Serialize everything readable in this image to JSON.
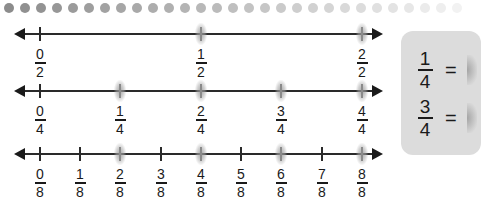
{
  "decoration": {
    "dot_row": {
      "count": 29,
      "start_x": 0,
      "spacing": 16,
      "color_start": "#8c8c8c",
      "color_end": "#f2f2f2"
    }
  },
  "number_lines": [
    {
      "id": "halves",
      "denominator": 2,
      "y": 33,
      "ticks": [
        {
          "num": "0",
          "den": "2",
          "x": 40,
          "highlighted": false
        },
        {
          "num": "1",
          "den": "2",
          "x": 201,
          "highlighted": true
        },
        {
          "num": "2",
          "den": "2",
          "x": 362,
          "highlighted": true
        }
      ]
    },
    {
      "id": "quarters",
      "denominator": 4,
      "y": 90,
      "ticks": [
        {
          "num": "0",
          "den": "4",
          "x": 40,
          "highlighted": false
        },
        {
          "num": "1",
          "den": "4",
          "x": 120,
          "highlighted": true
        },
        {
          "num": "2",
          "den": "4",
          "x": 201,
          "highlighted": true
        },
        {
          "num": "3",
          "den": "4",
          "x": 281,
          "highlighted": true
        },
        {
          "num": "4",
          "den": "4",
          "x": 362,
          "highlighted": true
        }
      ]
    },
    {
      "id": "eighths",
      "denominator": 8,
      "y": 153,
      "ticks": [
        {
          "num": "0",
          "den": "8",
          "x": 40,
          "highlighted": false
        },
        {
          "num": "1",
          "den": "8",
          "x": 80,
          "highlighted": false
        },
        {
          "num": "2",
          "den": "8",
          "x": 120,
          "highlighted": true
        },
        {
          "num": "3",
          "den": "8",
          "x": 161,
          "highlighted": false
        },
        {
          "num": "4",
          "den": "8",
          "x": 201,
          "highlighted": true
        },
        {
          "num": "5",
          "den": "8",
          "x": 241,
          "highlighted": false
        },
        {
          "num": "6",
          "den": "8",
          "x": 281,
          "highlighted": true
        },
        {
          "num": "7",
          "den": "8",
          "x": 322,
          "highlighted": false
        },
        {
          "num": "8",
          "den": "8",
          "x": 362,
          "highlighted": true
        }
      ]
    }
  ],
  "equivalence_panel": {
    "background": "#dcdcdc",
    "equations": [
      {
        "num": "1",
        "den": "4",
        "equals": "="
      },
      {
        "num": "3",
        "den": "4",
        "equals": "="
      }
    ]
  }
}
